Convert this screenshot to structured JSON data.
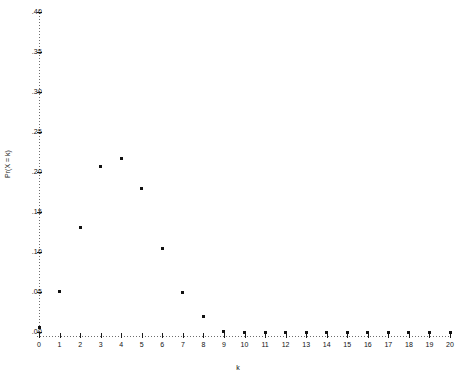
{
  "chart_data": {
    "type": "scatter",
    "title": "",
    "xlabel": "k",
    "ylabel": "Pr(X = k)",
    "xlim": [
      0,
      20
    ],
    "ylim": [
      0,
      0.4
    ],
    "grid": false,
    "legend": null,
    "x": [
      0,
      1,
      2,
      3,
      4,
      5,
      6,
      7,
      8,
      9,
      10,
      11,
      12,
      13,
      14,
      15,
      16,
      17,
      18,
      19,
      20
    ],
    "values": [
      0.006,
      0.051,
      0.131,
      0.207,
      0.217,
      0.179,
      0.104,
      0.05,
      0.019,
      0.001,
      0.0,
      0.0,
      0.0,
      0.0,
      0.0,
      0.0,
      0.0,
      0.0,
      0.0,
      0.0,
      0.0
    ],
    "categories": [
      "0",
      "1",
      "2",
      "3",
      "4",
      "5",
      "6",
      "7",
      "8",
      "9",
      "10",
      "11",
      "12",
      "13",
      "14",
      "15",
      "16",
      "17",
      "18",
      "19",
      "20"
    ],
    "yticks": [
      0.0,
      0.05,
      0.1,
      0.15,
      0.2,
      0.25,
      0.3,
      0.35,
      0.4
    ],
    "ytick_labels": [
      ".00",
      ".05",
      ".10",
      ".15",
      ".20",
      ".25",
      ".30",
      ".35",
      ".40"
    ],
    "xticks": [
      0,
      1,
      2,
      3,
      4,
      5,
      6,
      7,
      8,
      9,
      10,
      11,
      12,
      13,
      14,
      15,
      16,
      17,
      18,
      19,
      20
    ],
    "xtick_labels": [
      "0",
      "1",
      "2",
      "3",
      "4",
      "5",
      "6",
      "7",
      "8",
      "9",
      "10",
      "11",
      "12",
      "13",
      "14",
      "15",
      "16",
      "17",
      "18",
      "19",
      "20"
    ],
    "marker_color": "#111111",
    "axis_color": "#6d6d6d"
  }
}
